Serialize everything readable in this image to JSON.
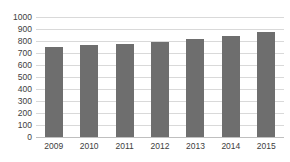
{
  "chart_data": {
    "type": "bar",
    "title": "",
    "xlabel": "",
    "ylabel": "",
    "categories": [
      "2009",
      "2010",
      "2011",
      "2012",
      "2013",
      "2014",
      "2015"
    ],
    "values": [
      750,
      765,
      775,
      795,
      818,
      843,
      878
    ],
    "ylim": [
      0,
      1000
    ],
    "ytick_step": 100,
    "yticks": [
      "1000",
      "900",
      "800",
      "700",
      "600",
      "500",
      "400",
      "300",
      "200",
      "100",
      "0"
    ],
    "grid": true,
    "legend": false,
    "legend_position": "none",
    "bar_color": "#6e6e6e",
    "gridline_color": "#d9d9d9",
    "axis_text_color": "#3d3d3d",
    "background_color": "#ffffff"
  }
}
